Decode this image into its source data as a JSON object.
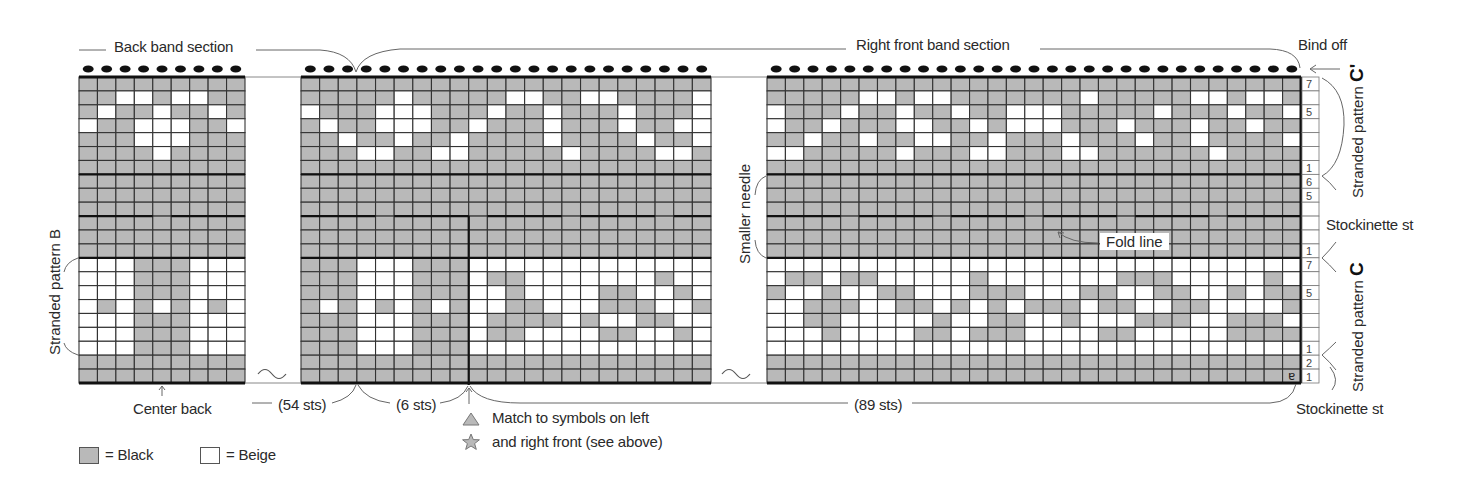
{
  "labels": {
    "back_band": "Back band section",
    "right_front_band": "Right front band section",
    "bind_off": "Bind off",
    "stranded_b": "Stranded pattern B",
    "stranded_c_prime_text": "Stranded pattern ",
    "stranded_c_prime_letter": "C'",
    "stranded_c_text": "Stranded pattern ",
    "stranded_c_letter": "C",
    "stockinette_upper": "Stockinette st",
    "stockinette_lower": "Stockinette st",
    "smaller_needle": "Smaller needle",
    "fold_line": "Fold line",
    "center_back": "Center back",
    "sts_54": "(54 sts)",
    "sts_6": "(6 sts)",
    "sts_89": "(89 sts)",
    "match_line1": "Match to symbols on left",
    "match_line2": "and right front (see above)",
    "end_marker": "ɐ"
  },
  "legend": [
    {
      "symbol": "gray-square",
      "label": "= Black",
      "color": "#b9b9b9"
    },
    {
      "symbol": "white-square",
      "label": "= Beige",
      "color": "#ffffff"
    }
  ],
  "colors": {
    "black_yarn": "#b9b9b9",
    "beige_yarn": "#ffffff",
    "grid_line": "#333333",
    "heavy_line": "#111111",
    "annotation": "#555555"
  },
  "row_numbers": [
    "7",
    "",
    "5",
    "",
    "",
    "",
    "1",
    "6",
    "5",
    "",
    "",
    "",
    "1",
    "7",
    "",
    "5",
    "",
    "",
    "",
    "1",
    "2",
    "1"
  ],
  "chart": {
    "rows": 22,
    "sections": [
      {
        "name": "back-band",
        "cols": 9,
        "grid": [
          "111111111",
          "110010011",
          "101101101",
          "011000110",
          "111000111",
          "111101111",
          "111111111",
          "111111111",
          "111111111",
          "111111111",
          "111111111",
          "111111111",
          "111111111",
          "000111000",
          "000111000",
          "000111000",
          "010101010",
          "000111000",
          "000111000",
          "000111000",
          "111111111",
          "111111111"
        ]
      },
      {
        "name": "right-front-start",
        "cols": 22,
        "grid": [
          "1111111111111111111111",
          "1111101111100110011110",
          "0111000111011011101110",
          "1011000110111011101100",
          "1101101101111011110110",
          "1110011001111101111001",
          "1111111111111111111111",
          "1111111111111111111111",
          "1111111111111111111111",
          "1111111111111111111111",
          "1111111111111111111111",
          "1111111111111111111111",
          "1111111111111111111111",
          "1110001110000000000000",
          "1110001110110000000100",
          "1110001110010000110010",
          "1010101010011000111001",
          "1110001110111101001100",
          "1110001110110000110010",
          "1110001110000000000000",
          "1111111111111111111111",
          "1111111111111111111111"
        ]
      },
      {
        "name": "right-front-end",
        "cols": 29,
        "grid": [
          "11111111111111111111111111111",
          "11111001001111111011111001001",
          "01110110110110001111101110110",
          "01101110011010001110111011011",
          "11011011001101110111011011110",
          "00111110111001110011111101111",
          "11111111111111111111111111111",
          "11111111111111111111111111111",
          "11111111111111111111111111111",
          "11111111111111111111111111111",
          "11111111111111111111111111111",
          "11111111111111111111111111111",
          "11111111111111111111111111111",
          "00000000000000000000000000000",
          "01101100000100000001110000010",
          "10010011000111000110011001011",
          "00111001101010111011001100001",
          "00110000010011001000111001110",
          "00010000110111000011000001111",
          "00000000000000000000000000000",
          "11111111111111111111111111111",
          "11111111111111111111111111111"
        ]
      }
    ]
  }
}
